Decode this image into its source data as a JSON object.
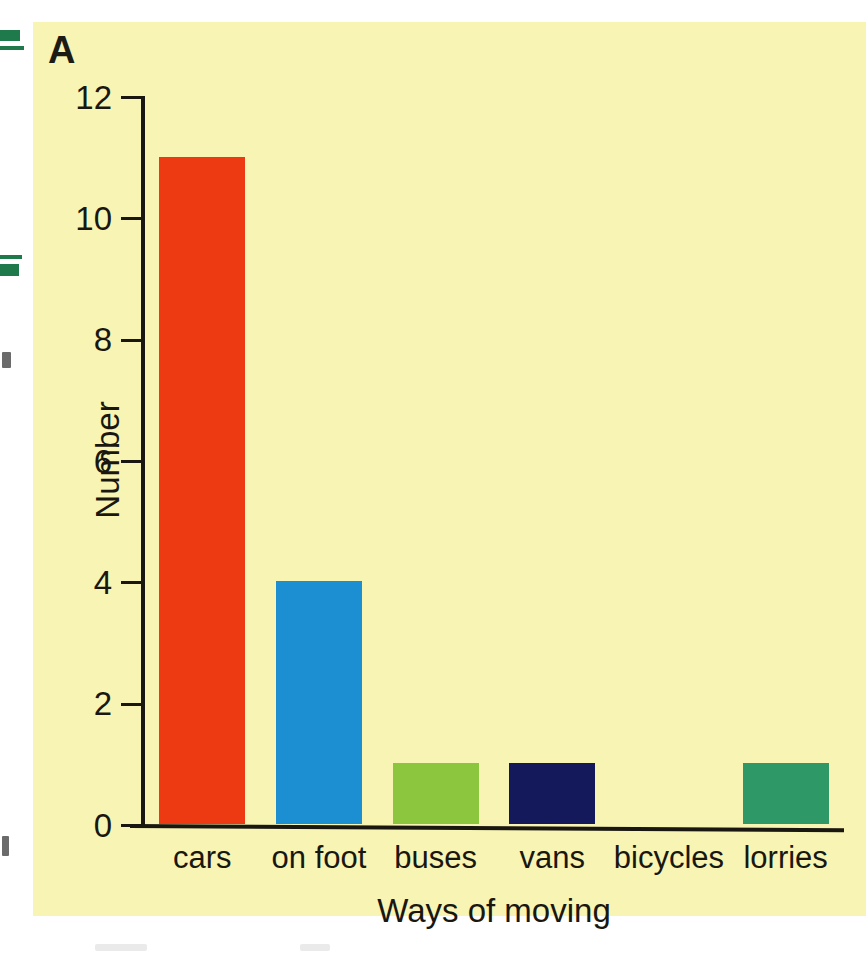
{
  "figure": {
    "panel_label": "A",
    "background_color": "#f7f4b4"
  },
  "chart_data": {
    "type": "bar",
    "title": "",
    "xlabel": "Ways of moving",
    "ylabel": "Number",
    "categories": [
      "cars",
      "on foot",
      "buses",
      "vans",
      "bicycles",
      "lorries"
    ],
    "values": [
      11,
      4,
      1,
      1,
      0,
      1
    ],
    "bar_colors": [
      "#ee3a13",
      "#1b8fd1",
      "#8cc63e",
      "#14195c",
      "#f7f4b4",
      "#2e9966"
    ],
    "ylim": [
      0,
      12
    ],
    "yticks": [
      0,
      2,
      4,
      6,
      8,
      10,
      12
    ],
    "ytick_labels": [
      "0",
      "2",
      "4",
      "6",
      "8",
      "10",
      "12"
    ],
    "grid": false,
    "legend": null
  },
  "margin_artifacts": {
    "description": "scan edge fragments",
    "marks": [
      {
        "name": "green-mark-top",
        "top": 30,
        "height": 11,
        "width": 20,
        "color": "#1e7a4a"
      },
      {
        "name": "green-rule-top",
        "top": 46,
        "height": 4,
        "width": 24,
        "color": "#1e7a4a"
      },
      {
        "name": "green-rule-mid",
        "top": 255,
        "height": 4,
        "width": 22,
        "color": "#1e7a4a"
      },
      {
        "name": "green-mark-mid",
        "top": 264,
        "height": 12,
        "width": 19,
        "color": "#1e7a4a"
      }
    ],
    "smudges": [
      {
        "name": "glyph-fragment-upper",
        "top": 352,
        "width": 9,
        "height": 16
      },
      {
        "name": "glyph-fragment-lower",
        "top": 836,
        "width": 7,
        "height": 20
      }
    ]
  }
}
